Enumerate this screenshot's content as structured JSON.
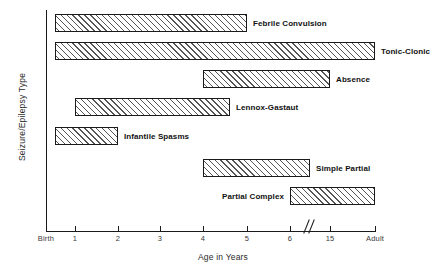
{
  "chart_data": {
    "type": "bar",
    "orientation": "horizontal-range",
    "title": "",
    "xlabel": "Age in Years",
    "ylabel": "Seizure/Epilepsy Type",
    "grid": false,
    "legend": null,
    "axis_break": {
      "present": true,
      "between": [
        "6",
        "15"
      ],
      "symbol": "//"
    },
    "x_ticks": [
      {
        "label": "Birth",
        "px": 46
      },
      {
        "label": "1",
        "px": 75
      },
      {
        "label": "2",
        "px": 118
      },
      {
        "label": "3",
        "px": 160
      },
      {
        "label": "4",
        "px": 203
      },
      {
        "label": "5",
        "px": 247
      },
      {
        "label": "6",
        "px": 290
      },
      {
        "label": "15",
        "px": 330
      },
      {
        "label": "Adult",
        "px": 375
      }
    ],
    "categories": [
      "Febrile Convulsion",
      "Tonic-Clonic",
      "Absence",
      "Lennox-Gastaut",
      "Infantile Spasms",
      "Simple Partial",
      "Partial Complex"
    ],
    "bars": [
      {
        "label": "Febrile Convulsion",
        "start_label": "0.5",
        "end_label": "5",
        "x": 55,
        "y": 14,
        "w": 192,
        "h": 18,
        "label_side": "right"
      },
      {
        "label": "Tonic-Clonic",
        "start_label": "0.5",
        "end_label": "Adult",
        "x": 55,
        "y": 42,
        "w": 320,
        "h": 18,
        "label_side": "right"
      },
      {
        "label": "Absence",
        "start_label": "4",
        "end_label": "15",
        "x": 203,
        "y": 70,
        "w": 127,
        "h": 18,
        "label_side": "right"
      },
      {
        "label": "Lennox-Gastaut",
        "start_label": "1",
        "end_label": "6",
        "x": 75,
        "y": 98,
        "w": 155,
        "h": 18,
        "label_side": "right"
      },
      {
        "label": "Infantile Spasms",
        "start_label": "0.5",
        "end_label": "2",
        "x": 55,
        "y": 127,
        "w": 63,
        "h": 18,
        "label_side": "right"
      },
      {
        "label": "Simple Partial",
        "start_label": "4",
        "end_label": "15",
        "x": 203,
        "y": 159,
        "w": 107,
        "h": 18,
        "label_side": "right"
      },
      {
        "label": "Partial Complex",
        "start_label": "6",
        "end_label": "Adult",
        "x": 290,
        "y": 187,
        "w": 85,
        "h": 18,
        "label_side": "left"
      }
    ],
    "colors": {
      "axis": "#1a1a1a",
      "bar_border": "#1a1a1a",
      "bar_fill": "#eeeeee",
      "hatch": "#555555",
      "tick_label": "#3a3a3a",
      "title": "#2b2b2b",
      "background": "#ffffff"
    }
  }
}
